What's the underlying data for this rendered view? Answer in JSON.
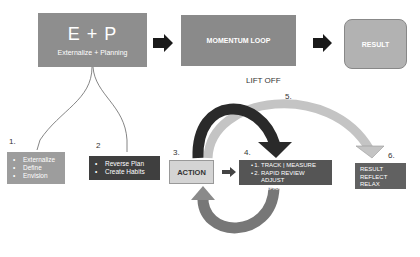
{
  "flow": {
    "ep": {
      "title": "E + P",
      "subtitle": "Externalize + Planning"
    },
    "momentum": {
      "label": "MOMENTUM LOOP"
    },
    "result": {
      "label": "RESULT"
    }
  },
  "steps": {
    "s1": {
      "number": "1.",
      "items": [
        "Externalize",
        "Define",
        "Envision"
      ]
    },
    "s2": {
      "number": "2",
      "items": [
        "Reverse Plan",
        "Create Habits"
      ]
    },
    "s3": {
      "number": "3.",
      "label": "ACTION"
    },
    "s4": {
      "number": "4.",
      "items": [
        "TRACK | MEASURE",
        "RAPID REVIEW ADJUST",
        "REFRAME FAILURE"
      ]
    },
    "s5": {
      "number": "5.",
      "label": "LIFT OFF"
    },
    "s6": {
      "number": "6.",
      "items": [
        "RESULT",
        "REFLECT",
        "RELAX"
      ]
    }
  },
  "colors": {
    "ep_box": "#8e8e8e",
    "momentum_box": "#8a8a8a",
    "result_box": "#b2b2b2",
    "box1": "#9d9d9d",
    "box2": "#3f3f3f",
    "action_box": "#d4d4d4",
    "box4": "#555555",
    "box6": "#616161",
    "arrow_dark": "#2a2a2a",
    "arrow_light": "#c4c4c4",
    "arrow_mid": "#7a7a7a"
  }
}
